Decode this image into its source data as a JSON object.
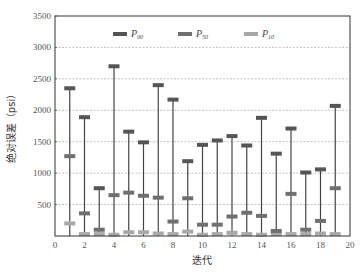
{
  "chart_data": {
    "type": "range-marker",
    "title": "",
    "xlabel": "迭代",
    "ylabel": "绝对误差（psi）",
    "xlim": [
      0,
      20
    ],
    "ylim": [
      0,
      3500
    ],
    "xticks": [
      0,
      2,
      4,
      6,
      8,
      10,
      12,
      14,
      16,
      18,
      20
    ],
    "yticks": [
      500,
      1000,
      1500,
      2000,
      2500,
      3000,
      3500
    ],
    "y_origin_label": "0",
    "grid": "horizontal dashed",
    "legend_position": "top inside",
    "x": [
      1,
      2,
      3,
      4,
      5,
      6,
      7,
      8,
      9,
      10,
      11,
      12,
      13,
      14,
      15,
      16,
      17,
      18,
      19
    ],
    "series": [
      {
        "name": "P90",
        "label_main": "P",
        "label_sub": "90",
        "color": "#555555",
        "values": [
          2350,
          1890,
          760,
          2700,
          1660,
          1490,
          2400,
          2170,
          1190,
          1450,
          1520,
          1590,
          1440,
          1880,
          1310,
          1710,
          1010,
          1060,
          2070
        ]
      },
      {
        "name": "P50",
        "label_main": "P",
        "label_sub": "50",
        "color": "#707070",
        "values": [
          1270,
          360,
          100,
          650,
          690,
          640,
          610,
          230,
          600,
          180,
          180,
          310,
          370,
          320,
          80,
          670,
          100,
          240,
          760
        ]
      },
      {
        "name": "P10",
        "label_main": "P",
        "label_sub": "10",
        "color": "#a8a8a8",
        "values": [
          200,
          30,
          30,
          20,
          60,
          60,
          40,
          30,
          70,
          20,
          30,
          50,
          30,
          20,
          30,
          30,
          30,
          40,
          30
        ]
      }
    ]
  },
  "colors": {
    "axis": "#333333",
    "grid": "#999999",
    "whisker": "#444444"
  }
}
